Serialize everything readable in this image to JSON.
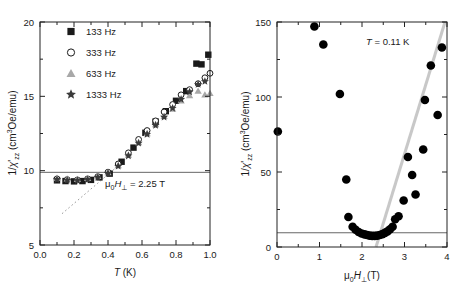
{
  "figure": {
    "panels": [
      "left",
      "right"
    ],
    "background": "#ffffff"
  },
  "left_panel": {
    "ylabel_main": "1/",
    "ylabel_chi": "'",
    "ylabel_sub": "zz",
    "ylabel_units": " (cm",
    "ylabel_sup": "3",
    "ylabel_tail": "Oe/emu)",
    "xlabel_italic": "T",
    "xlabel_unit": " (K)",
    "xticks": [
      "0.0",
      "0.2",
      "0.4",
      "0.6",
      "0.8",
      "1.0"
    ],
    "yticks": [
      "5",
      "10",
      "15",
      "20"
    ],
    "annotation": " = 2.25 T",
    "annotation_mu": "μ",
    "annotation_mu_sub": "0",
    "annotation_H": "H",
    "annotation_H_sub": "⊥",
    "legend": [
      {
        "marker": "filled-square",
        "label": "133 Hz",
        "color": "#1a1a1a"
      },
      {
        "marker": "open-circle",
        "label": "333 Hz",
        "color": "#1a1a1a"
      },
      {
        "marker": "filled-triangle",
        "label": "633 Hz",
        "color": "#a8a8a8"
      },
      {
        "marker": "filled-star",
        "label": "1333 Hz",
        "color": "#3a3a3a"
      }
    ]
  },
  "right_panel": {
    "ylabel_main": "1/",
    "ylabel_chi": "'",
    "ylabel_sub": "zz",
    "ylabel_units": " (cm",
    "ylabel_sup": "3",
    "ylabel_tail": "Oe/emu)",
    "xlabel_mu": "μ",
    "xlabel_mu_sub": "0",
    "xlabel_H": "H",
    "xlabel_H_sub": "⊥",
    "xlabel_unit": "(T)",
    "xticks": [
      "0",
      "1",
      "2",
      "3",
      "4"
    ],
    "yticks": [
      "0",
      "50",
      "100",
      "150"
    ],
    "annotation_italic": "T",
    "annotation_rest": " = 0.11 K"
  },
  "chart_data": [
    {
      "type": "scatter",
      "panel": "left",
      "title": "",
      "xlabel": "T (K)",
      "ylabel": "1/χ'_zz (cm3Oe/emu)",
      "xlim": [
        0.0,
        1.0
      ],
      "ylim": [
        5,
        20
      ],
      "xticks": [
        0.0,
        0.2,
        0.4,
        0.6,
        0.8,
        1.0
      ],
      "yticks": [
        5,
        10,
        15,
        20
      ],
      "grid": false,
      "legend_position": "upper-left",
      "annotations": [
        {
          "text": "μ0H⊥ = 2.25 T",
          "x": 0.56,
          "y": 9.0
        }
      ],
      "reference_lines": [
        {
          "type": "horizontal",
          "y": 9.5,
          "style": "solid",
          "color": "#555555"
        },
        {
          "type": "dotted-guide",
          "x0": 0.13,
          "y0": 6.7,
          "x1": 0.53,
          "y1": 10.6,
          "style": "dotted",
          "color": "#999999"
        }
      ],
      "series": [
        {
          "name": "133 Hz",
          "marker": "filled-square",
          "color": "#1a1a1a",
          "x": [
            0.1,
            0.15,
            0.2,
            0.25,
            0.3,
            0.35,
            0.41,
            0.48,
            0.55,
            0.62,
            0.68,
            0.74,
            0.8,
            0.86,
            0.92,
            0.95,
            0.99
          ],
          "y": [
            9.35,
            9.3,
            9.28,
            9.3,
            9.38,
            9.55,
            9.8,
            10.6,
            11.55,
            12.55,
            13.3,
            14.0,
            14.7,
            15.35,
            17.2,
            17.15,
            17.8
          ]
        },
        {
          "name": "333 Hz",
          "marker": "open-circle",
          "color": "#1a1a1a",
          "x": [
            0.1,
            0.16,
            0.22,
            0.28,
            0.34,
            0.4,
            0.46,
            0.52,
            0.58,
            0.63,
            0.68,
            0.73,
            0.78,
            0.83,
            0.88,
            0.93,
            0.97,
            1.0
          ],
          "y": [
            9.45,
            9.4,
            9.38,
            9.45,
            9.6,
            9.9,
            10.45,
            11.2,
            12.1,
            12.7,
            13.35,
            13.95,
            14.45,
            15.1,
            15.45,
            15.85,
            16.25,
            16.55
          ]
        },
        {
          "name": "633 Hz",
          "marker": "filled-triangle",
          "color": "#a8a8a8",
          "x": [
            0.1,
            0.16,
            0.22,
            0.28,
            0.34,
            0.4,
            0.46,
            0.52,
            0.58,
            0.63,
            0.68,
            0.73,
            0.78,
            0.83,
            0.88,
            0.93,
            0.97,
            1.0
          ],
          "y": [
            9.5,
            9.45,
            9.42,
            9.48,
            9.62,
            9.88,
            10.35,
            11.05,
            11.9,
            12.5,
            13.1,
            13.65,
            14.15,
            14.7,
            15.05,
            15.35,
            15.1,
            15.2
          ]
        },
        {
          "name": "1333 Hz",
          "marker": "filled-star",
          "color": "#3a3a3a",
          "x": [
            0.1,
            0.16,
            0.22,
            0.28,
            0.34,
            0.4,
            0.46,
            0.52,
            0.58,
            0.63,
            0.68,
            0.73,
            0.78,
            0.83,
            0.88,
            0.93,
            0.97
          ],
          "y": [
            9.4,
            9.36,
            9.34,
            9.4,
            9.55,
            9.82,
            10.3,
            11.0,
            11.85,
            12.45,
            13.05,
            13.6,
            14.2,
            14.8,
            15.3,
            15.8,
            16.0
          ]
        }
      ]
    },
    {
      "type": "scatter",
      "panel": "right",
      "title": "",
      "xlabel": "μ0H⊥ (T)",
      "ylabel": "1/χ'_zz (cm3Oe/emu)",
      "xlim": [
        0,
        4
      ],
      "ylim": [
        0,
        150
      ],
      "xticks": [
        0,
        1,
        2,
        3,
        4
      ],
      "yticks": [
        0,
        50,
        100,
        150
      ],
      "grid": false,
      "annotations": [
        {
          "text": "T = 0.11 K",
          "x": 2.55,
          "y": 136
        }
      ],
      "reference_lines": [
        {
          "type": "horizontal",
          "y": 9.5,
          "style": "solid",
          "color": "#555555"
        },
        {
          "type": "fit",
          "x0": 2.33,
          "y0": 0,
          "x1": 3.95,
          "y1": 150,
          "style": "solid-thick",
          "color": "#c8c8c8"
        }
      ],
      "series": [
        {
          "name": "1/chi vs field",
          "marker": "filled-circle",
          "color": "#000000",
          "x": [
            0.02,
            0.88,
            1.09,
            1.48,
            1.63,
            1.68,
            1.78,
            1.85,
            1.92,
            1.99,
            2.06,
            2.12,
            2.18,
            2.24,
            2.3,
            2.36,
            2.42,
            2.48,
            2.54,
            2.6,
            2.66,
            2.72,
            2.78,
            2.86,
            2.98,
            3.08,
            3.18,
            3.26,
            3.44,
            3.48,
            3.62,
            3.78,
            3.88
          ],
          "y": [
            77,
            147,
            135,
            102,
            45,
            20,
            13.5,
            11.5,
            10.0,
            9.0,
            8.4,
            8.0,
            7.6,
            7.4,
            7.4,
            7.6,
            8.0,
            8.6,
            9.4,
            10.4,
            11.8,
            13.5,
            18.5,
            20.5,
            31,
            60,
            48,
            35,
            65,
            98,
            121,
            88,
            133
          ]
        }
      ]
    }
  ]
}
